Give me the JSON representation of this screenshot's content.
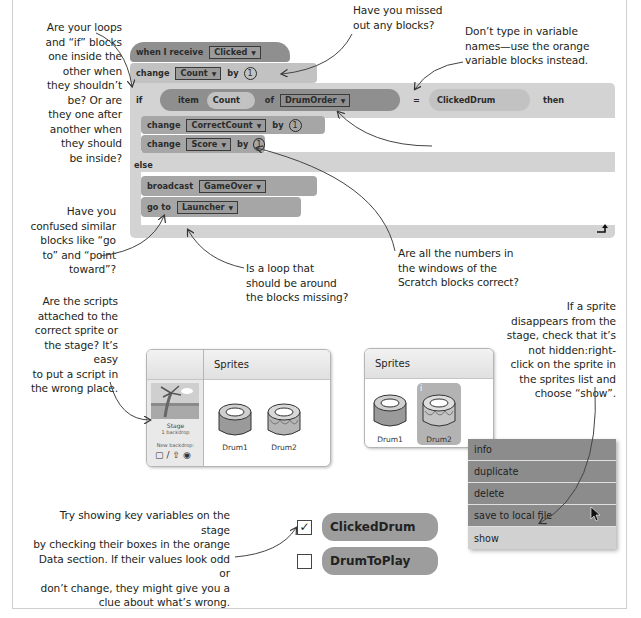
{
  "notes": {
    "loops": "Are your loops\nand “if” blocks\none inside the\nother when\nthey shouldn’t\nbe? Or are\nthey one after\nanother when\nthey should\nbe inside?",
    "missed_blocks": "Have you missed\nout any blocks?",
    "variable_names": "Don’t type in variable\nnames—use the orange\nvariable blocks instead.",
    "dropdown": "Have you selected the correct\nitem in the drop-down menus?",
    "confused_blocks": "Have you\nconfused similar\nblocks like “go\nto” and “point\ntoward”?",
    "loop_missing": "Is a loop that\nshould be around\nthe blocks missing?",
    "numbers": "Are all the numbers in\nthe windows of the\nScratch blocks correct?",
    "scripts_attached": "Are the scripts\nattached to the\ncorrect sprite or\nthe stage? It’s easy\nto put a script in\nthe wrong place.",
    "hidden_sprite": "If a sprite\ndisappears from the\nstage, check that it’s\nnot hidden:right-\nclick on the sprite in\nthe sprites list and\nchoose “show”.",
    "show_variables": "Try showing key variables on the stage\nby checking their boxes in the orange\nData section. If their values look odd or\ndon’t change, they might give you a\nclue about what’s wrong."
  },
  "script": {
    "hat": {
      "label": "when I receive",
      "dropdown": "Clicked"
    },
    "change_count": {
      "label": "change",
      "dropdown": "Count",
      "by": "by",
      "value": "1"
    },
    "if_block": {
      "if_label": "if",
      "item_label": "item",
      "item_var": "Count",
      "of_label": "of",
      "list_dropdown": "DrumOrder",
      "equals": "=",
      "compare_var": "ClickedDrum",
      "then_label": "then"
    },
    "change_correct": {
      "label": "change",
      "dropdown": "CorrectCount",
      "by": "by",
      "value": "1"
    },
    "change_score": {
      "label": "change",
      "dropdown": "Score",
      "by": "by",
      "value": "1"
    },
    "else_label": "else",
    "broadcast": {
      "label": "broadcast",
      "dropdown": "GameOver"
    },
    "goto": {
      "label": "go to",
      "dropdown": "Launcher"
    },
    "dropdown_arrow": "▼"
  },
  "sprites_panel_1": {
    "header": "Sprites",
    "stage": {
      "label": "Stage",
      "sub": "1 backdrop",
      "new_backdrop": "New backdrop:"
    },
    "sprites": [
      {
        "name": "Drum1"
      },
      {
        "name": "Drum2"
      }
    ]
  },
  "sprites_panel_2": {
    "header": "Sprites",
    "sprites": [
      {
        "name": "Drum1"
      },
      {
        "name": "Drum2",
        "selected": true
      }
    ],
    "info_badge": "i"
  },
  "context_menu": {
    "items": [
      {
        "label": "info"
      },
      {
        "label": "duplicate"
      },
      {
        "label": "delete"
      },
      {
        "label": "save to local file"
      },
      {
        "label": "show",
        "active": true
      }
    ]
  },
  "variables": [
    {
      "name": "ClickedDrum",
      "checked": true,
      "check_mark": "✓"
    },
    {
      "name": "DrumToPlay",
      "checked": false,
      "check_mark": ""
    }
  ]
}
